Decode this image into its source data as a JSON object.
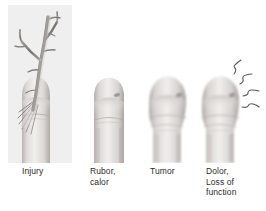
{
  "figure": {
    "background_color": "#ffffff",
    "plate_color": "#efefef",
    "ink_color": "#2b2b2b",
    "skin_light": "#f3f1ef",
    "skin_mid": "#d8d4d1",
    "skin_shadow": "#a9a3a0",
    "thorn_color": "#8c8a88",
    "width": 266,
    "height": 211
  },
  "panels": [
    {
      "id": "injury",
      "index": 1,
      "caption": "Injury",
      "has_plate": true,
      "art": "finger-with-thorn",
      "description": "Fingertip pierced by a branching thorn"
    },
    {
      "id": "rubor-calor",
      "index": 2,
      "caption": "Rubor,\ncalor",
      "has_plate": false,
      "art": "finger-slightly-swollen",
      "description": "Finger showing redness and heat"
    },
    {
      "id": "tumor",
      "index": 3,
      "caption": "Tumor",
      "has_plate": false,
      "art": "finger-swollen",
      "description": "Finger showing marked swelling"
    },
    {
      "id": "dolor",
      "index": 4,
      "caption": "Dolor,\nLoss of\nfunction",
      "has_plate": false,
      "art": "finger-swollen-with-pain-lines",
      "description": "Swollen finger with radiating pain squiggles",
      "pain_line_count": 4
    }
  ]
}
